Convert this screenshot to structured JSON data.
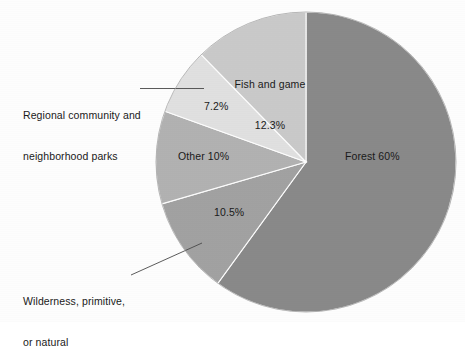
{
  "chart_data": {
    "type": "pie",
    "title": "",
    "subtitle": "",
    "xlabel": "",
    "ylabel": "",
    "legend_position": "none",
    "grid": false,
    "categories": [
      "Forest",
      "Wilderness, primitive, or natural",
      "Other",
      "Regional community and neighborhood parks",
      "Fish and game"
    ],
    "values": [
      60,
      10.5,
      10,
      7.2,
      12.3
    ],
    "value_labels": [
      "60%",
      "10.5%",
      "10%",
      "7.2%",
      "12.3%"
    ],
    "colors": [
      "#8a8a8a",
      "#a3a3a3",
      "#b3b3b3",
      "#e2e2e2",
      "#cbcbcb"
    ],
    "start_angle_deg": 0,
    "direction": "clockwise",
    "slices": [
      {
        "name": "Forest",
        "value": 60,
        "label_inside": "Forest 60%",
        "label_type": "inside",
        "color": "#8a8a8a",
        "start_deg": 0,
        "sweep_deg": 216
      },
      {
        "name": "Wilderness, primitive, or natural",
        "value": 10.5,
        "label_inside": "10.5%",
        "label_callout": "Wilderness, primitive,\nor natural",
        "label_type": "callout",
        "color": "#a3a3a3",
        "start_deg": 216,
        "sweep_deg": 37.8
      },
      {
        "name": "Other",
        "value": 10,
        "label_inside": "Other 10%",
        "label_type": "inside",
        "color": "#b3b3b3",
        "start_deg": 253.8,
        "sweep_deg": 36
      },
      {
        "name": "Regional community and neighborhood parks",
        "value": 7.2,
        "label_inside": "7.2%",
        "label_callout": "Regional community and\nneighborhood parks",
        "label_type": "callout",
        "color": "#e2e2e2",
        "start_deg": 289.8,
        "sweep_deg": 25.9
      },
      {
        "name": "Fish and game",
        "value": 12.3,
        "label_inside": "Fish and game\n12.3%",
        "label_type": "inside",
        "color": "#cbcbcb",
        "start_deg": 315.7,
        "sweep_deg": 44.3
      }
    ]
  },
  "labels": {
    "forest": "Forest 60%",
    "fish_and_game_line1": "Fish and game",
    "fish_and_game_line2": "12.3%",
    "regional_pct": "7.2%",
    "other": "Other 10%",
    "wilderness_pct": "10.5%",
    "regional_callout_line1": "Regional community and",
    "regional_callout_line2": "neighborhood parks",
    "wilderness_callout_line1": "Wilderness, primitive,",
    "wilderness_callout_line2": "or natural"
  }
}
